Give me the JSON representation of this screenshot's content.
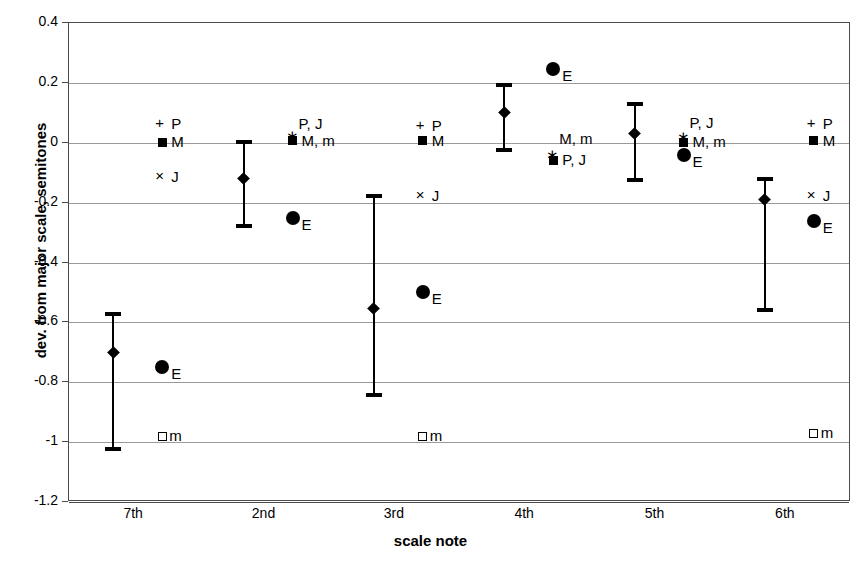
{
  "chart_data": {
    "type": "scatter",
    "title": "",
    "xlabel": "scale note",
    "ylabel": "dev. from major scale, semitones",
    "ylim": [
      -1.2,
      0.4
    ],
    "ytick_labels": [
      "0.4",
      "0.2",
      "0",
      "-0.2",
      "-0.4",
      "-0.6",
      "-0.8",
      "-1",
      "-1.2"
    ],
    "ytick_values": [
      0.4,
      0.2,
      0,
      -0.2,
      -0.4,
      -0.6,
      -0.8,
      -1,
      -1.2
    ],
    "grid": true,
    "legend": "none",
    "categories": [
      "7th",
      "2nd",
      "3rd",
      "4th",
      "5th",
      "6th"
    ],
    "series": [
      {
        "name": "measured mean with range",
        "marker": "diamond-with-error-bar",
        "mean": [
          -0.7,
          -0.12,
          -0.555,
          0.1,
          0.03,
          -0.19
        ],
        "upper": [
          -0.565,
          0.01,
          -0.17,
          0.2,
          0.135,
          -0.115
        ],
        "lower": [
          -1.03,
          -0.285,
          -0.85,
          -0.03,
          -0.13,
          -0.565
        ]
      },
      {
        "name": "E",
        "marker": "filled-circle",
        "values": [
          -0.75,
          -0.25,
          -0.5,
          0.245,
          -0.02,
          -0.26
        ]
      },
      {
        "name": "M",
        "marker": "filled-square",
        "values": [
          0.005,
          0.005,
          0.01,
          -0.01,
          -0.005,
          0.01
        ]
      },
      {
        "name": "m",
        "marker": "open-square",
        "values": [
          -1.0,
          null,
          -1.0,
          null,
          null,
          -0.99
        ]
      }
    ],
    "annotations": [
      {
        "note": "7th",
        "labels": [
          {
            "text": "+P",
            "y": 0.085,
            "glyph": "plus"
          },
          {
            "text": "M",
            "y": 0.025,
            "glyph": "square-filled"
          },
          {
            "text": "×J",
            "y": -0.09,
            "glyph": "times"
          },
          {
            "text": "E",
            "y": -0.75,
            "glyph": "circle-filled"
          },
          {
            "text": "m",
            "y": -0.955,
            "glyph": "square-open"
          }
        ]
      },
      {
        "note": "2nd",
        "labels": [
          {
            "text": "P, J",
            "y": 0.085,
            "glyph": "none"
          },
          {
            "text": "∗M, m",
            "y": 0.03,
            "glyph": "asterisk-square"
          },
          {
            "text": "E",
            "y": -0.25,
            "glyph": "circle-filled"
          }
        ]
      },
      {
        "note": "3rd",
        "labels": [
          {
            "text": "+P",
            "y": 0.08,
            "glyph": "plus"
          },
          {
            "text": "M",
            "y": 0.03,
            "glyph": "square-filled"
          },
          {
            "text": "× J",
            "y": -0.155,
            "glyph": "times"
          },
          {
            "text": "E",
            "y": -0.5,
            "glyph": "circle-filled"
          },
          {
            "text": "m",
            "y": -0.955,
            "glyph": "square-open"
          }
        ]
      },
      {
        "note": "4th",
        "labels": [
          {
            "text": "E",
            "y": 0.245,
            "glyph": "circle-filled"
          },
          {
            "text": "M, m",
            "y": 0.035,
            "glyph": "none"
          },
          {
            "text": "P, J",
            "y": -0.035,
            "glyph": "asterisk-square"
          }
        ]
      },
      {
        "note": "5th",
        "labels": [
          {
            "text": "P, J",
            "y": 0.09,
            "glyph": "none"
          },
          {
            "text": "M, m",
            "y": 0.025,
            "glyph": "asterisk-square"
          },
          {
            "text": "E",
            "y": -0.04,
            "glyph": "circle-filled"
          }
        ]
      },
      {
        "note": "6th",
        "labels": [
          {
            "text": "+P",
            "y": 0.085,
            "glyph": "plus"
          },
          {
            "text": "M",
            "y": 0.03,
            "glyph": "square-filled"
          },
          {
            "text": "×J",
            "y": -0.155,
            "glyph": "times"
          },
          {
            "text": "E",
            "y": -0.26,
            "glyph": "circle-filled"
          },
          {
            "text": "m",
            "y": -0.945,
            "glyph": "square-open"
          }
        ]
      }
    ],
    "marker_legend_keys": {
      "P": "Pythagorean",
      "M": "Major",
      "J": "Just",
      "m": "minor",
      "E": "Equal"
    },
    "colors": {
      "marker": "#000000",
      "grid": "#9a9a9a",
      "axis": "#4a4a4a",
      "background": "#ffffff"
    }
  }
}
